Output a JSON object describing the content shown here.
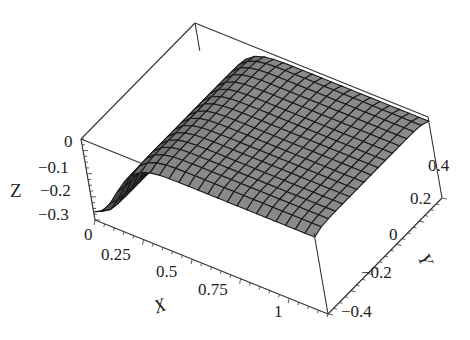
{
  "chart_data": {
    "type": "surface3d",
    "title": "",
    "xlabel": "X",
    "ylabel": "Y",
    "zlabel": "Z",
    "xlim": [
      0,
      1.2
    ],
    "ylim": [
      -0.5,
      0.5
    ],
    "zlim": [
      -0.35,
      0
    ],
    "x_ticks": [
      "0",
      "0.25",
      "0.5",
      "0.75",
      "1"
    ],
    "y_ticks": [
      "-0.4",
      "-0.2",
      "0",
      "0.2",
      "0.4"
    ],
    "z_ticks": [
      "0",
      "-0.1",
      "-0.2",
      "-0.3"
    ],
    "surface_description": "Z rises steeply from about -0.35 at X=0 to about -0.05 near X=0.3, then stays nearly flat close to 0 for larger X; nearly constant along Y with slight rounding at the Y edges",
    "surface_color": "#8a8a8a",
    "mesh_color": "#1a1a1a",
    "grid": false,
    "box": true
  },
  "labels": {
    "x_axis": "X",
    "y_axis": "Y",
    "z_axis": "Z",
    "x_ticks": [
      {
        "text": "0",
        "left": 84,
        "top": 226
      },
      {
        "text": "0.25",
        "left": 101,
        "top": 246
      },
      {
        "text": "0.5",
        "left": 156,
        "top": 263
      },
      {
        "text": "0.75",
        "left": 198,
        "top": 281
      },
      {
        "text": "1",
        "left": 274,
        "top": 303
      }
    ],
    "y_ticks": [
      {
        "text": "−0.4",
        "left": 341,
        "top": 303
      },
      {
        "text": "−0.2",
        "left": 361,
        "top": 264
      },
      {
        "text": "0",
        "left": 389,
        "top": 226
      },
      {
        "text": "0.2",
        "left": 410,
        "top": 190
      },
      {
        "text": "0.4",
        "left": 428,
        "top": 157
      }
    ],
    "z_ticks": [
      {
        "text": "0",
        "left": 64,
        "top": 133
      },
      {
        "text": "−0.1",
        "left": 38,
        "top": 159
      },
      {
        "text": "−0.2",
        "left": 40,
        "top": 182
      },
      {
        "text": "−0.3",
        "left": 38,
        "top": 206
      }
    ]
  }
}
